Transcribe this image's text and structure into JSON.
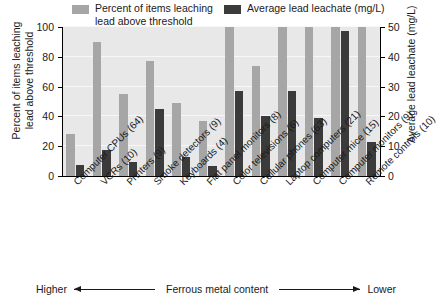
{
  "chart_data": {
    "type": "bar",
    "title": "",
    "subtitle": "",
    "xlabel": "",
    "ylabel": "Percent of items leaching\nlead above threshold",
    "y2label": "Average lead leachate (mg/L)",
    "ylim": [
      0,
      100
    ],
    "y2lim": [
      0,
      50
    ],
    "yticks": [
      "0",
      "20",
      "40",
      "60",
      "80",
      "100"
    ],
    "ytick_values": [
      0,
      20,
      40,
      60,
      80,
      100
    ],
    "y2ticks": [
      "0",
      "10",
      "20",
      "30",
      "40",
      "50"
    ],
    "y2tick_values": [
      0,
      10,
      20,
      30,
      40,
      50
    ],
    "grid": true,
    "legend_position": "top",
    "categories": [
      "Computer CPUs (64)",
      "VCRs (10)",
      "Printers (9)",
      "Smoke detectors (9)",
      "Keyboards (4)",
      "Flat panel monitors (8)",
      "Color televisions (6)",
      "Cellular phones (63)",
      "Laptop computers (21)",
      "Computer mice (15)",
      "Computer monitors (9)",
      "Remote controls (10)"
    ],
    "series": [
      {
        "name": "Percent of items leaching\nlead above threshold",
        "axis": "left",
        "unit": "%",
        "color": "#a6a6a6",
        "values": [
          28,
          90,
          55,
          77,
          49,
          37,
          100,
          74,
          100,
          100,
          100,
          100
        ]
      },
      {
        "name": "Average lead leachate (mg/L)",
        "axis": "right",
        "unit": "mg/L",
        "color": "#3b3b3b",
        "values": [
          3.8,
          8.8,
          4.8,
          22.5,
          6.5,
          3.5,
          28.5,
          20.0,
          28.5,
          19.5,
          48.5,
          11.5
        ]
      }
    ],
    "annotation": {
      "left_label": "Higher",
      "center_label": "Ferrous metal content",
      "right_label": "Lower"
    }
  },
  "legend": {
    "entries": [
      {
        "label": "Percent of items leaching\nlead above threshold",
        "color": "#a6a6a6"
      },
      {
        "label": "Average lead leachate (mg/L)",
        "color": "#3b3b3b"
      }
    ]
  },
  "colors": {
    "series_light": "#a6a6a6",
    "series_dark": "#3b3b3b",
    "plot_background": "#e8e8e8",
    "gridline": "#f7f7f7",
    "axis": "#000000",
    "text": "#1a1a1a"
  }
}
